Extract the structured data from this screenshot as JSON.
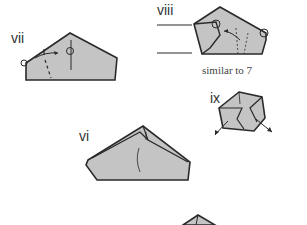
{
  "steps": [
    {
      "id": "vii",
      "label": "vii"
    },
    {
      "id": "viii",
      "label": "viii",
      "note": "similar to 7"
    },
    {
      "id": "ix",
      "label": "ix"
    },
    {
      "id": "vi",
      "label": "vi"
    }
  ],
  "colors": {
    "paper_fill": "#c4c4c4",
    "outline": "#2a2a2a",
    "background": "#ffffff"
  }
}
